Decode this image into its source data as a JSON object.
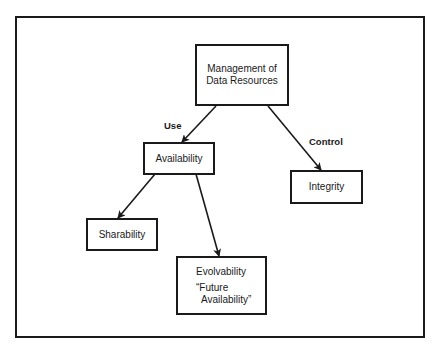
{
  "diagram": {
    "nodes": {
      "root": {
        "text": "Management of Data Resources",
        "line1": "Management of",
        "line2": "Data Resources"
      },
      "availability": {
        "text": "Availability"
      },
      "integrity": {
        "text": "Integrity"
      },
      "sharability": {
        "text": "Sharability"
      },
      "evolvability": {
        "text": "Evolvability",
        "sub_line1": "“Future",
        "sub_line2": "Availability”"
      }
    },
    "edges": [
      {
        "from": "Management of Data Resources",
        "to": "Availability",
        "label": "Use"
      },
      {
        "from": "Management of Data Resources",
        "to": "Integrity",
        "label": "Control"
      },
      {
        "from": "Availability",
        "to": "Sharability",
        "label": ""
      },
      {
        "from": "Availability",
        "to": "Evolvability",
        "label": ""
      }
    ],
    "edge_labels": {
      "use": "Use",
      "control": "Control"
    },
    "colors": {
      "line": "#1a1a1a",
      "background": "#ffffff"
    }
  }
}
